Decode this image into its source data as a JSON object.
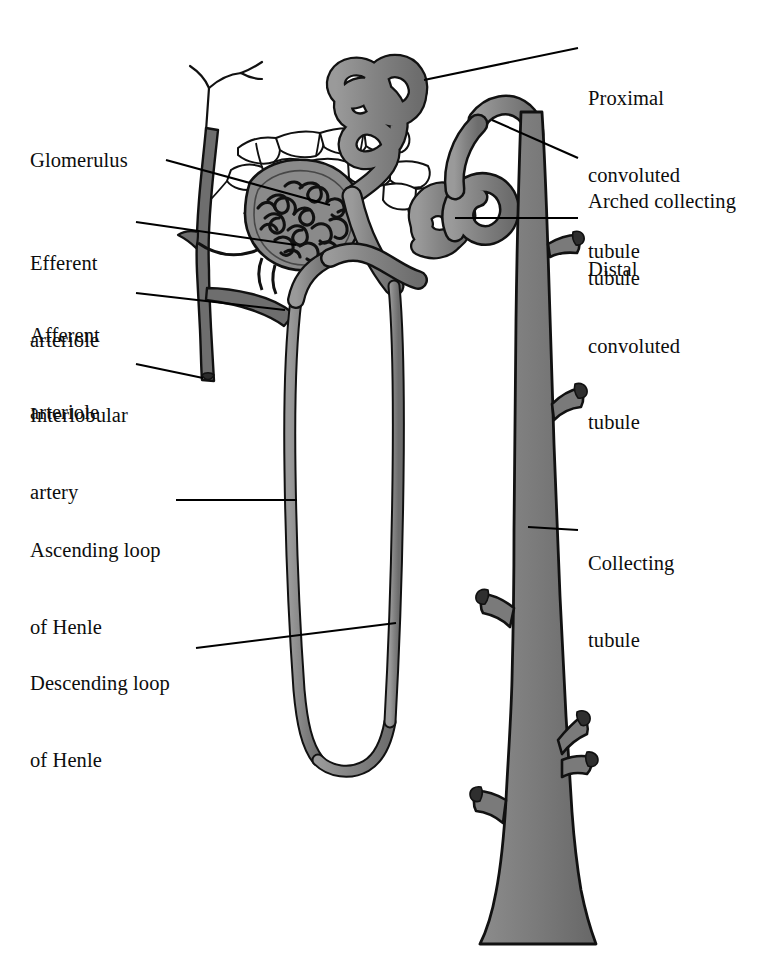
{
  "figure": {
    "background_color": "#ffffff",
    "ink_color": "#000000",
    "tubule_fill": "#808080",
    "vessel_fill": "#6e6e6e",
    "capsule_fill": "#8a8a8a",
    "capillary_fill": "#ffffff"
  },
  "labels": {
    "left": [
      {
        "id": "glomerulus",
        "text": "Glomerulus",
        "lines": [
          "Glomerulus"
        ],
        "x": 30,
        "y": 148
      },
      {
        "id": "efferent-arteriole",
        "text": "Efferent arteriole",
        "lines": [
          "Efferent",
          "arteriole"
        ],
        "x": 30,
        "y": 200
      },
      {
        "id": "afferent-arteriole",
        "text": "Afferent arteriole",
        "lines": [
          "Afferent",
          "arteriole"
        ],
        "x": 30,
        "y": 272
      },
      {
        "id": "interlobular-artery",
        "text": "Interlobular artery",
        "lines": [
          "Interlobular",
          "artery"
        ],
        "x": 30,
        "y": 352
      },
      {
        "id": "ascending-loop-of-henle",
        "text": "Ascending loop of Henle",
        "lines": [
          "Ascending loop",
          "of Henle"
        ],
        "x": 30,
        "y": 487
      },
      {
        "id": "descending-loop-of-henle",
        "text": "Descending loop of Henle",
        "lines": [
          "Descending loop",
          "of Henle"
        ],
        "x": 30,
        "y": 620
      }
    ],
    "right": [
      {
        "id": "proximal-convoluted-tubule",
        "text": "Proximal convoluted tubule",
        "lines": [
          "Proximal",
          "convoluted",
          "tubule"
        ],
        "x": 588,
        "y": 35
      },
      {
        "id": "arched-collecting-tubule",
        "text": "Arched collecting tubule",
        "lines": [
          "Arched collecting",
          "tubule"
        ],
        "x": 588,
        "y": 138
      },
      {
        "id": "distal-convoluted-tubule",
        "text": "Distal convoluted tubule",
        "lines": [
          "Distal",
          "convoluted",
          "tubule"
        ],
        "x": 588,
        "y": 206
      },
      {
        "id": "collecting-tubule",
        "text": "Collecting tubule",
        "lines": [
          "Collecting",
          "tubule"
        ],
        "x": 588,
        "y": 500
      }
    ]
  },
  "margin_note": "",
  "structures": [
    {
      "id": "glomerular-capillary-tuft",
      "name": "glomerular capillary tuft"
    },
    {
      "id": "bowmans-capsule",
      "name": "Bowman's capsule"
    },
    {
      "id": "afferent-arteriole-vessel",
      "name": "afferent arteriole"
    },
    {
      "id": "efferent-arteriole-vessel",
      "name": "efferent arteriole"
    },
    {
      "id": "interlobular-artery-vessel",
      "name": "interlobular artery"
    },
    {
      "id": "peritubular-capillary-network",
      "name": "peritubular capillary network"
    },
    {
      "id": "proximal-convoluted-tubule-shape",
      "name": "proximal convoluted tubule"
    },
    {
      "id": "distal-convoluted-tubule-shape",
      "name": "distal convoluted tubule"
    },
    {
      "id": "descending-limb",
      "name": "descending limb of loop of Henle"
    },
    {
      "id": "ascending-limb",
      "name": "ascending limb of loop of Henle"
    },
    {
      "id": "loop-of-henle-bend",
      "name": "loop of Henle bend"
    },
    {
      "id": "arched-collecting-tubule-shape",
      "name": "arched collecting tubule"
    },
    {
      "id": "collecting-duct",
      "name": "collecting duct"
    }
  ],
  "leader_lines": [
    {
      "id": "leader-glomerulus",
      "from": [
        166,
        160
      ],
      "to": [
        330,
        205
      ]
    },
    {
      "id": "leader-efferent",
      "from": [
        136,
        222
      ],
      "to": [
        296,
        245
      ]
    },
    {
      "id": "leader-afferent",
      "from": [
        136,
        293
      ],
      "to": [
        285,
        310
      ]
    },
    {
      "id": "leader-interlobular",
      "from": [
        136,
        364
      ],
      "to": [
        203,
        378
      ]
    },
    {
      "id": "leader-ascending",
      "from": [
        176,
        500
      ],
      "to": [
        297,
        500
      ]
    },
    {
      "id": "leader-descending",
      "from": [
        196,
        648
      ],
      "to": [
        396,
        623
      ]
    },
    {
      "id": "leader-proximal",
      "from": [
        578,
        48
      ],
      "to": [
        424,
        80
      ]
    },
    {
      "id": "leader-arched",
      "from": [
        578,
        158
      ],
      "to": [
        492,
        120
      ]
    },
    {
      "id": "leader-distal",
      "from": [
        578,
        218
      ],
      "to": [
        455,
        218
      ]
    },
    {
      "id": "leader-collecting",
      "from": [
        578,
        530
      ],
      "to": [
        528,
        527
      ]
    }
  ]
}
